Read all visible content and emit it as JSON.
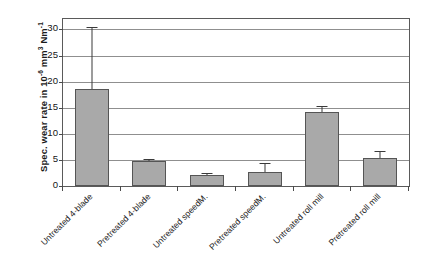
{
  "chart_data": {
    "type": "bar",
    "title": "",
    "xlabel": "",
    "ylabel": "Spec. wear rate in 10-6 mm3 Nm-1",
    "ylabel_parts": {
      "prefix": "Spec. wear rate in 10",
      "exp1": "-6",
      "mid": " mm",
      "exp2": "3",
      "suffix": " Nm",
      "exp3": "-1"
    },
    "ylim": [
      0,
      32
    ],
    "yticks": [
      0,
      5,
      10,
      15,
      20,
      25,
      30
    ],
    "ytick_labels": [
      "0",
      "5",
      "10",
      "15",
      "20",
      "25",
      "30"
    ],
    "grid": true,
    "legend": "none",
    "categories": [
      "Untreated 4-blade",
      "Pretreated 4-blade",
      "Untreated speedM.",
      "Pretreated speedM.",
      "Untreated roll mill",
      "Pretreated roll mill"
    ],
    "values": [
      18.5,
      4.8,
      2.1,
      2.6,
      14.2,
      5.4
    ],
    "errors_upper": [
      30.4,
      5.2,
      2.4,
      4.4,
      15.4,
      6.7
    ],
    "bar_color": "#a9a9a9",
    "bar_edge_color": "#555555",
    "grid_color": "#8f8f8f",
    "axis_color": "#5a5a5a"
  }
}
